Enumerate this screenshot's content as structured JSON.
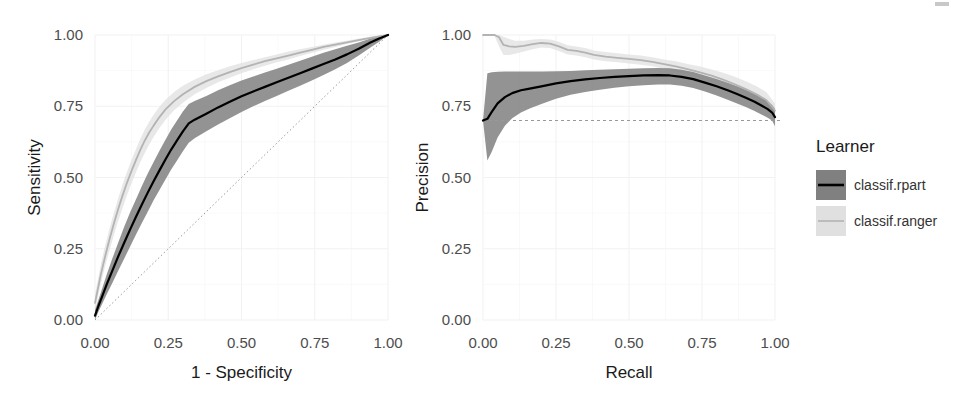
{
  "figure": {
    "background": "#ffffff",
    "width": 964,
    "height": 413
  },
  "legend": {
    "title": "Learner",
    "position": "right",
    "items": [
      {
        "label": "classif.rpart",
        "line_color": "#000000",
        "ribbon_color": "#808080"
      },
      {
        "label": "classif.ranger",
        "line_color": "#b3b3b3",
        "ribbon_color": "#e0e0e0"
      }
    ]
  },
  "chart_data": [
    {
      "type": "line",
      "id": "roc",
      "title": "",
      "xlabel": "1 - Specificity",
      "ylabel": "Sensitivity",
      "xlim": [
        0,
        1
      ],
      "ylim": [
        0,
        1
      ],
      "xticks": [
        "0.00",
        "0.25",
        "0.50",
        "0.75",
        "1.00"
      ],
      "yticks": [
        "0.00",
        "0.25",
        "0.50",
        "0.75",
        "1.00"
      ],
      "xtick_values": [
        0,
        0.25,
        0.5,
        0.75,
        1
      ],
      "ytick_values": [
        0,
        0.25,
        0.5,
        0.75,
        1
      ],
      "grid": true,
      "legend_position": "right",
      "reference_line": {
        "type": "diagonal",
        "from": [
          0,
          0
        ],
        "to": [
          1,
          1
        ],
        "style": "dotted",
        "color": "#999999"
      },
      "series": [
        {
          "name": "classif.rpart",
          "color": "#000000",
          "ribbon_color": "#808080",
          "x": [
            0.0,
            0.012,
            0.025,
            0.04,
            0.06,
            0.08,
            0.1,
            0.12,
            0.14,
            0.16,
            0.18,
            0.2,
            0.22,
            0.24,
            0.26,
            0.28,
            0.3,
            0.32,
            0.34,
            0.38,
            0.42,
            0.46,
            0.5,
            0.54,
            0.58,
            0.62,
            0.66,
            0.7,
            0.74,
            0.78,
            0.82,
            0.86,
            0.9,
            0.94,
            0.97,
            1.0
          ],
          "y": [
            0.015,
            0.05,
            0.085,
            0.125,
            0.175,
            0.225,
            0.272,
            0.318,
            0.362,
            0.405,
            0.447,
            0.487,
            0.525,
            0.562,
            0.598,
            0.63,
            0.662,
            0.69,
            0.703,
            0.724,
            0.746,
            0.766,
            0.785,
            0.802,
            0.818,
            0.834,
            0.85,
            0.866,
            0.882,
            0.898,
            0.914,
            0.932,
            0.952,
            0.974,
            0.988,
            1.0
          ],
          "ylow": [
            0.0,
            0.03,
            0.058,
            0.09,
            0.132,
            0.175,
            0.216,
            0.258,
            0.3,
            0.34,
            0.38,
            0.42,
            0.456,
            0.492,
            0.528,
            0.56,
            0.592,
            0.622,
            0.638,
            0.662,
            0.686,
            0.708,
            0.73,
            0.75,
            0.768,
            0.786,
            0.804,
            0.822,
            0.84,
            0.86,
            0.88,
            0.902,
            0.928,
            0.956,
            0.976,
            1.0
          ],
          "yhigh": [
            0.035,
            0.072,
            0.112,
            0.16,
            0.218,
            0.274,
            0.328,
            0.378,
            0.424,
            0.47,
            0.514,
            0.554,
            0.594,
            0.632,
            0.668,
            0.7,
            0.732,
            0.758,
            0.768,
            0.786,
            0.806,
            0.824,
            0.84,
            0.854,
            0.868,
            0.882,
            0.896,
            0.91,
            0.924,
            0.938,
            0.95,
            0.962,
            0.974,
            0.988,
            0.996,
            1.0
          ]
        },
        {
          "name": "classif.ranger",
          "color": "#b3b3b3",
          "ribbon_color": "#e0e0e0",
          "x": [
            0.0,
            0.01,
            0.02,
            0.035,
            0.05,
            0.065,
            0.08,
            0.095,
            0.11,
            0.125,
            0.14,
            0.155,
            0.17,
            0.185,
            0.2,
            0.22,
            0.24,
            0.27,
            0.3,
            0.34,
            0.38,
            0.42,
            0.46,
            0.5,
            0.54,
            0.58,
            0.62,
            0.66,
            0.7,
            0.74,
            0.78,
            0.82,
            0.86,
            0.9,
            0.95,
            1.0
          ],
          "y": [
            0.06,
            0.11,
            0.16,
            0.225,
            0.285,
            0.34,
            0.392,
            0.44,
            0.484,
            0.524,
            0.562,
            0.598,
            0.63,
            0.658,
            0.682,
            0.712,
            0.738,
            0.768,
            0.792,
            0.818,
            0.838,
            0.855,
            0.87,
            0.884,
            0.896,
            0.908,
            0.918,
            0.928,
            0.938,
            0.948,
            0.958,
            0.966,
            0.974,
            0.982,
            0.992,
            1.0
          ],
          "ylow": [
            0.03,
            0.08,
            0.128,
            0.19,
            0.246,
            0.3,
            0.35,
            0.396,
            0.44,
            0.48,
            0.518,
            0.554,
            0.586,
            0.616,
            0.642,
            0.674,
            0.702,
            0.736,
            0.762,
            0.792,
            0.814,
            0.834,
            0.85,
            0.866,
            0.88,
            0.892,
            0.904,
            0.914,
            0.926,
            0.938,
            0.948,
            0.958,
            0.968,
            0.978,
            0.99,
            1.0
          ],
          "yhigh": [
            0.09,
            0.142,
            0.196,
            0.262,
            0.322,
            0.378,
            0.43,
            0.478,
            0.522,
            0.562,
            0.6,
            0.636,
            0.668,
            0.696,
            0.72,
            0.748,
            0.772,
            0.8,
            0.822,
            0.844,
            0.862,
            0.876,
            0.89,
            0.902,
            0.912,
            0.922,
            0.932,
            0.942,
            0.95,
            0.958,
            0.966,
            0.974,
            0.98,
            0.988,
            0.996,
            1.0
          ]
        }
      ]
    },
    {
      "type": "line",
      "id": "prc",
      "title": "",
      "xlabel": "Recall",
      "ylabel": "Precision",
      "xlim": [
        0,
        1
      ],
      "ylim": [
        0,
        1
      ],
      "xticks": [
        "0.00",
        "0.25",
        "0.50",
        "0.75",
        "1.00"
      ],
      "yticks": [
        "0.00",
        "0.25",
        "0.50",
        "0.75",
        "1.00"
      ],
      "xtick_values": [
        0,
        0.25,
        0.5,
        0.75,
        1
      ],
      "ytick_values": [
        0,
        0.25,
        0.5,
        0.75,
        1
      ],
      "grid": true,
      "legend_position": "right",
      "reference_line": {
        "type": "horizontal",
        "y": 0.7,
        "style": "dashed",
        "color": "#999999"
      },
      "series": [
        {
          "name": "classif.rpart",
          "color": "#000000",
          "ribbon_color": "#808080",
          "x": [
            0.0,
            0.015,
            0.03,
            0.05,
            0.075,
            0.1,
            0.13,
            0.16,
            0.2,
            0.25,
            0.3,
            0.35,
            0.4,
            0.45,
            0.5,
            0.55,
            0.6,
            0.64,
            0.68,
            0.72,
            0.76,
            0.8,
            0.84,
            0.87,
            0.9,
            0.93,
            0.955,
            0.975,
            0.99,
            1.0
          ],
          "y": [
            0.7,
            0.706,
            0.73,
            0.76,
            0.782,
            0.796,
            0.806,
            0.812,
            0.82,
            0.83,
            0.838,
            0.844,
            0.849,
            0.853,
            0.856,
            0.858,
            0.859,
            0.858,
            0.853,
            0.845,
            0.833,
            0.82,
            0.805,
            0.793,
            0.78,
            0.766,
            0.752,
            0.74,
            0.728,
            0.712
          ],
          "ylow": [
            0.7,
            0.56,
            0.59,
            0.64,
            0.682,
            0.708,
            0.728,
            0.742,
            0.758,
            0.776,
            0.79,
            0.8,
            0.808,
            0.815,
            0.82,
            0.824,
            0.826,
            0.826,
            0.822,
            0.814,
            0.802,
            0.788,
            0.772,
            0.76,
            0.747,
            0.733,
            0.72,
            0.71,
            0.7,
            0.68
          ],
          "yhigh": [
            0.7,
            0.866,
            0.869,
            0.871,
            0.872,
            0.872,
            0.872,
            0.872,
            0.872,
            0.873,
            0.874,
            0.876,
            0.878,
            0.88,
            0.882,
            0.883,
            0.884,
            0.883,
            0.878,
            0.87,
            0.858,
            0.846,
            0.832,
            0.82,
            0.808,
            0.794,
            0.78,
            0.768,
            0.754,
            0.74
          ]
        },
        {
          "name": "classif.ranger",
          "color": "#b3b3b3",
          "ribbon_color": "#e0e0e0",
          "x": [
            0.0,
            0.02,
            0.04,
            0.055,
            0.07,
            0.09,
            0.11,
            0.14,
            0.17,
            0.2,
            0.23,
            0.26,
            0.29,
            0.32,
            0.35,
            0.38,
            0.42,
            0.46,
            0.5,
            0.54,
            0.58,
            0.62,
            0.66,
            0.7,
            0.74,
            0.78,
            0.82,
            0.86,
            0.9,
            0.94,
            0.97,
            1.0
          ],
          "y": [
            1.0,
            1.0,
            1.0,
            0.992,
            0.965,
            0.96,
            0.958,
            0.962,
            0.968,
            0.972,
            0.97,
            0.96,
            0.948,
            0.944,
            0.938,
            0.93,
            0.924,
            0.92,
            0.916,
            0.912,
            0.906,
            0.898,
            0.89,
            0.88,
            0.87,
            0.858,
            0.844,
            0.828,
            0.81,
            0.79,
            0.772,
            0.735
          ],
          "ylow": [
            1.0,
            1.0,
            0.996,
            0.96,
            0.93,
            0.93,
            0.934,
            0.942,
            0.95,
            0.956,
            0.954,
            0.944,
            0.932,
            0.928,
            0.922,
            0.914,
            0.908,
            0.904,
            0.9,
            0.896,
            0.89,
            0.882,
            0.872,
            0.862,
            0.85,
            0.836,
            0.82,
            0.802,
            0.784,
            0.764,
            0.748,
            0.712
          ],
          "yhigh": [
            1.0,
            1.0,
            1.0,
            1.0,
            0.994,
            0.986,
            0.98,
            0.98,
            0.984,
            0.986,
            0.984,
            0.976,
            0.964,
            0.96,
            0.954,
            0.946,
            0.94,
            0.936,
            0.932,
            0.928,
            0.922,
            0.914,
            0.908,
            0.898,
            0.89,
            0.88,
            0.868,
            0.854,
            0.838,
            0.818,
            0.8,
            0.76
          ]
        }
      ]
    }
  ]
}
